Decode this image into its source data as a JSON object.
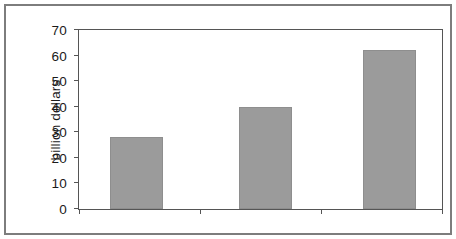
{
  "chart_data": {
    "type": "bar",
    "title": "",
    "subtitle": "",
    "xlabel": "",
    "ylabel": "billion dollars",
    "categories": [
      "2001-2010",
      "2011-2020",
      "2021-2030"
    ],
    "values": [
      28,
      40,
      62
    ],
    "series": [
      {
        "name": "billion dollars",
        "values": [
          28,
          40,
          62
        ]
      }
    ],
    "ylim": [
      0,
      70
    ],
    "yticks": [
      0,
      10,
      20,
      30,
      40,
      50,
      60,
      70
    ],
    "ytick_labels": [
      "0",
      "10",
      "20",
      "30",
      "40",
      "50",
      "60",
      "70"
    ],
    "grid": false,
    "legend": false,
    "legend_position": "none",
    "bar_color": "#9b9b9b",
    "axis_color": "#555555",
    "frame_color": "#7d7d7d",
    "background_color": "#ffffff",
    "text_color": "#1a1a1a",
    "annotations": []
  }
}
